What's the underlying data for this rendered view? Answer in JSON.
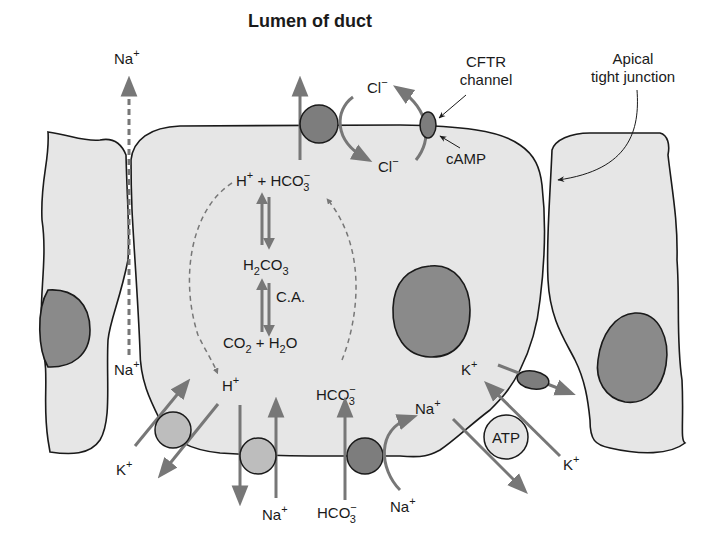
{
  "title": "Lumen of duct",
  "colors": {
    "cytoplasm": "#e6e6e6",
    "nucleus": "#8a8a8a",
    "transporter_dark": "#7d7d7d",
    "transporter_light": "#bdbdbd",
    "arrow": "#777777",
    "outline": "#1a1a1a"
  },
  "labels": {
    "na_paracellular_top": {
      "base": "Na",
      "sup": "+"
    },
    "na_paracellular_bottom": {
      "base": "Na",
      "sup": "+"
    },
    "cftr": [
      "CFTR",
      "channel"
    ],
    "camp": "cAMP",
    "cl_top": {
      "base": "Cl",
      "sup": "−"
    },
    "cl_inside": {
      "base": "Cl",
      "sup": "−"
    },
    "tight_junction": [
      "Apical",
      "tight junction"
    ],
    "reaction_top": {
      "h": "H",
      "h_sup": "+",
      "plus": " + ",
      "hco": "HCO",
      "hco_sub": "3",
      "hco_sup": "−"
    },
    "h2co3": {
      "a": "H",
      "a_sub": "2",
      "b": "CO",
      "b_sub": "3"
    },
    "ca": "C.A.",
    "co2_h2o": {
      "a": "CO",
      "a_sub": "2",
      "plus": " + ",
      "b": "H",
      "b_sub": "2",
      "c": "O"
    },
    "h_inside": {
      "base": "H",
      "sup": "+"
    },
    "hco3_inside": {
      "base": "HCO",
      "sub": "3",
      "sup": "−"
    },
    "hco3_outside": {
      "base": "HCO",
      "sub": "3",
      "sup": "−"
    },
    "na_bottom_left": {
      "base": "Na",
      "sup": "+"
    },
    "na_bottom_right": {
      "base": "Na",
      "sup": "+"
    },
    "na_inside": {
      "base": "Na",
      "sup": "+"
    },
    "k_left": {
      "base": "K",
      "sup": "+"
    },
    "k_inside": {
      "base": "K",
      "sup": "+"
    },
    "k_right": {
      "base": "K",
      "sup": "+"
    },
    "atp": "ATP"
  }
}
